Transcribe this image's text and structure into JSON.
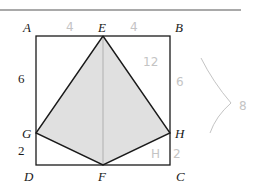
{
  "figure": {
    "type": "geometry-square-with-kite",
    "vertices": {
      "A": {
        "label": "A",
        "x": 36,
        "y": 36
      },
      "B": {
        "label": "B",
        "x": 170,
        "y": 36
      },
      "C": {
        "label": "C",
        "x": 170,
        "y": 165
      },
      "D": {
        "label": "D",
        "x": 36,
        "y": 165
      },
      "E": {
        "label": "E",
        "x": 103,
        "y": 36
      },
      "F": {
        "label": "F",
        "x": 103,
        "y": 165
      },
      "G": {
        "label": "G",
        "x": 36,
        "y": 133
      },
      "H": {
        "label": "H",
        "x": 170,
        "y": 133
      }
    },
    "printed_lengths": {
      "AG": "6",
      "GD": "2"
    },
    "shaded_region": "EGFH",
    "colors": {
      "stroke": "#1a1a1a",
      "fill": "#e0e0e0",
      "handwriting": "#c4c4c4"
    }
  },
  "handwritten_annotations": {
    "AE": "4",
    "EB": "4",
    "EH": "12",
    "BH": "6",
    "FH": "H",
    "HC": "2",
    "brace_total": "8"
  }
}
